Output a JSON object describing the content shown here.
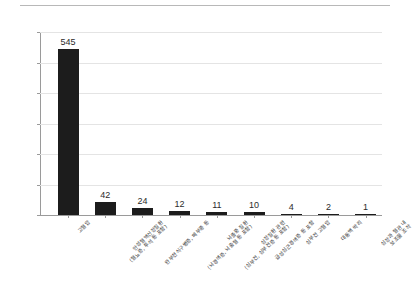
{
  "chart_data": {
    "type": "bar",
    "title": "",
    "xlabel": "",
    "ylabel": "",
    "ylim": [
      0,
      600
    ],
    "ytick_step": 100,
    "grid": true,
    "legend": "none",
    "orientation": "vertical",
    "bar_color": "#1c1c1c",
    "label_rotation_deg": -45,
    "categories": [
      "고혈압",
      "만성혈액신장질환\n(혈뇨증, 투석 등 포함)",
      "완부천식구병증, 폐부종 등",
      "(뇌경색증, 뇌출혈 등 포함)",
      "(심부전, 심부전증 등 포함)",
      "급성심근경색증 등 포함",
      "심부전 고혈압",
      "대동맥 박리",
      "심장과 혈관 내 보조물 조작"
    ],
    "category_lines": [
      [
        "고혈압",
        ""
      ],
      [
        "만성혈액신장질환",
        "(혈뇨증, 투석 등 포함)"
      ],
      [
        "완부천식구병증, 폐부종 등",
        ""
      ],
      [
        "뇌졸중 질환",
        "(뇌경색증, 뇌출혈 등 포함)"
      ],
      [
        "심장질환 관련",
        "(심부전, 심부전증 등 포함)"
      ],
      [
        "급성심근경색증 등 포함",
        ""
      ],
      [
        "심부전 고혈압",
        ""
      ],
      [
        "대동맥 박리",
        ""
      ],
      [
        "심장과 혈관 내",
        "보조물 조작"
      ]
    ],
    "values": [
      545,
      42,
      24,
      12,
      11,
      10,
      4,
      2,
      1
    ],
    "value_labels": [
      "545",
      "42",
      "24",
      "12",
      "11",
      "10",
      "4",
      "2",
      "1"
    ],
    "ytick_labels": [
      "0",
      "100",
      "200",
      "300",
      "400",
      "500",
      "600"
    ],
    "ytick_values": [
      0,
      100,
      200,
      300,
      400,
      500,
      600
    ]
  }
}
